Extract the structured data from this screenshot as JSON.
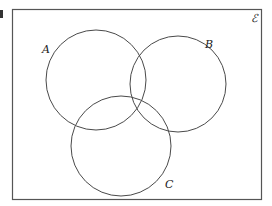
{
  "diagram": {
    "type": "venn",
    "universal_set_symbol": "ℰ",
    "figure_marker": "",
    "sets": [
      {
        "label": "A",
        "cx": 96,
        "cy": 80,
        "r": 50,
        "label_x": 42,
        "label_y": 53
      },
      {
        "label": "B",
        "cx": 178,
        "cy": 84,
        "r": 48,
        "label_x": 205,
        "label_y": 48
      },
      {
        "label": "C",
        "cx": 121,
        "cy": 146,
        "r": 50,
        "label_x": 165,
        "label_y": 188
      }
    ],
    "colors": {
      "stroke": "#4a4a4a",
      "background": "#ffffff"
    }
  }
}
